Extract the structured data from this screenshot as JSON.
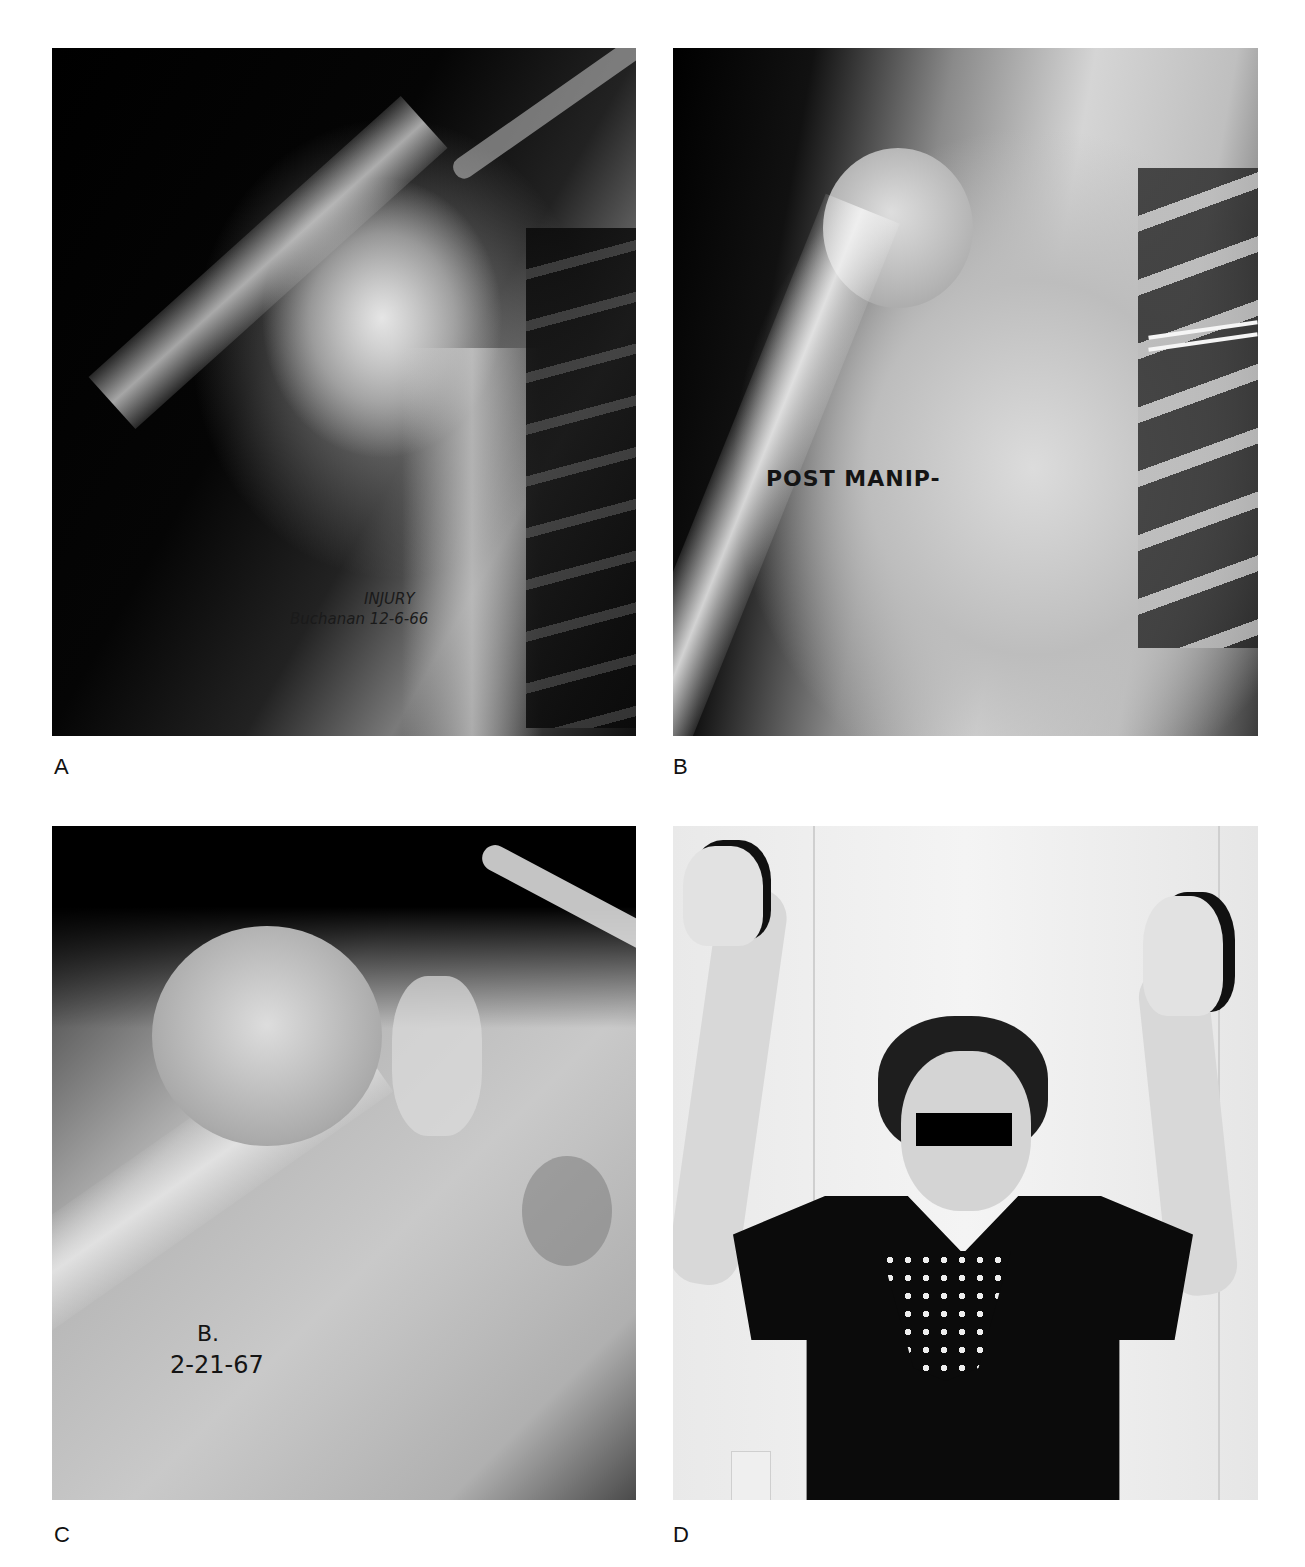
{
  "figure": {
    "panels": [
      {
        "id": "A",
        "label": "A",
        "kind": "x-ray",
        "annotation_lines": [
          "INJURY",
          "Buchanan 12-6-66"
        ]
      },
      {
        "id": "B",
        "label": "B",
        "kind": "x-ray",
        "annotation_lines": [
          "POST MANIP-"
        ]
      },
      {
        "id": "C",
        "label": "C",
        "kind": "x-ray",
        "annotation_lines": [
          "B.",
          "2-21-67"
        ]
      },
      {
        "id": "D",
        "label": "D",
        "kind": "photograph",
        "description": "Patient raising both arms overhead; eyes obscured by black bar"
      }
    ]
  }
}
